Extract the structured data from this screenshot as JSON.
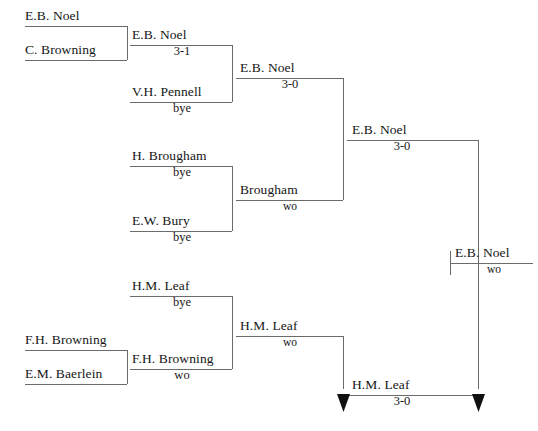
{
  "figure": {
    "kind": "single-elimination-tournament-bracket",
    "background_color": "#ffffff",
    "line_color": "#6b6b6b",
    "text_color": "#161616",
    "width": 538,
    "height": 431
  },
  "rounds": [
    {
      "round_index": 0,
      "name": "round-1",
      "entries": [
        {
          "id": "r1-m1-p1",
          "name": "E.B. Noel",
          "score": ""
        },
        {
          "id": "r1-m1-p2",
          "name": "C. Browning",
          "score": ""
        },
        {
          "id": "r1-m2-p1",
          "name": "F.H. Browning",
          "score": ""
        },
        {
          "id": "r1-m2-p2",
          "name": "E.M. Baerlein",
          "score": ""
        }
      ]
    },
    {
      "round_index": 1,
      "name": "round-2",
      "entries": [
        {
          "id": "r2-e1",
          "name": "E.B. Noel",
          "score": "3-1"
        },
        {
          "id": "r2-e2",
          "name": "V.H. Pennell",
          "score": "bye"
        },
        {
          "id": "r2-e3",
          "name": "H. Brougham",
          "score": "bye"
        },
        {
          "id": "r2-e4",
          "name": "E.W. Bury",
          "score": "bye"
        },
        {
          "id": "r2-e5",
          "name": "H.M. Leaf",
          "score": "bye"
        },
        {
          "id": "r2-e6",
          "name": "F.H. Browning",
          "score": "wo"
        }
      ]
    },
    {
      "round_index": 2,
      "name": "round-3",
      "entries": [
        {
          "id": "r3-e1",
          "name": "E.B. Noel",
          "score": "3-0"
        },
        {
          "id": "r3-e2",
          "name": "Brougham",
          "score": "wo"
        },
        {
          "id": "r3-e3",
          "name": "H.M. Leaf",
          "score": "wo"
        }
      ]
    },
    {
      "round_index": 3,
      "name": "round-4-semifinal",
      "entries": [
        {
          "id": "r4-e1",
          "name": "E.B. Noel",
          "score": "3-0"
        },
        {
          "id": "r4-e2",
          "name": "H.M. Leaf",
          "score": "3-0"
        }
      ]
    },
    {
      "round_index": 4,
      "name": "final-winner",
      "entries": [
        {
          "id": "r5-e1",
          "name": "E.B. Noel",
          "score": "wo"
        }
      ]
    }
  ],
  "labels": {
    "r1_m1_p1_name": "E.B. Noel",
    "r1_m1_p2_name": "C. Browning",
    "r1_m2_p1_name": "F.H. Browning",
    "r1_m2_p2_name": "E.M. Baerlein",
    "r2_e1_name": "E.B. Noel",
    "r2_e1_score": "3-1",
    "r2_e2_name": "V.H. Pennell",
    "r2_e2_score": "bye",
    "r2_e3_name": "H. Brougham",
    "r2_e3_score": "bye",
    "r2_e4_name": "E.W. Bury",
    "r2_e4_score": "bye",
    "r2_e5_name": "H.M. Leaf",
    "r2_e5_score": "bye",
    "r2_e6_name": "F.H. Browning",
    "r2_e6_score": "wo",
    "r3_e1_name": "E.B. Noel",
    "r3_e1_score": "3-0",
    "r3_e2_name": "Brougham",
    "r3_e2_score": "wo",
    "r3_e3_name": "H.M. Leaf",
    "r3_e3_score": "wo",
    "r4_e1_name": "E.B. Noel",
    "r4_e1_score": "3-0",
    "r4_e2_name": "H.M. Leaf",
    "r4_e2_score": "3-0",
    "r5_e1_name": "E.B. Noel",
    "r5_e1_score": "wo"
  }
}
